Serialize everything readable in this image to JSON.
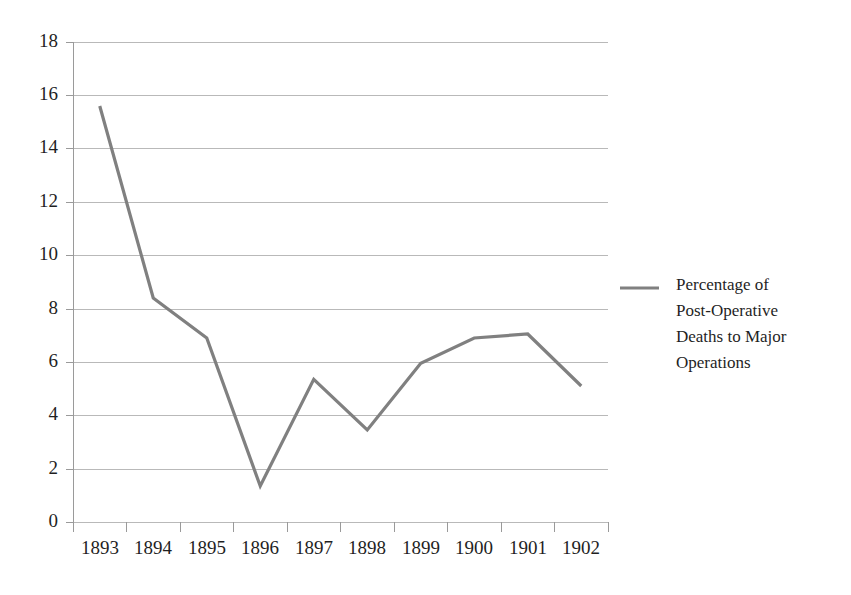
{
  "chart_data": {
    "type": "line",
    "title": "",
    "subtitle": "",
    "xlabel": "",
    "ylabel": "",
    "categories": [
      "1893",
      "1894",
      "1895",
      "1896",
      "1897",
      "1898",
      "1899",
      "1900",
      "1901",
      "1902"
    ],
    "series": [
      {
        "name": "Percentage of Post-Operative Deaths to Major Operations",
        "color": "#808080",
        "values": [
          15.6,
          8.4,
          6.9,
          1.35,
          5.35,
          3.45,
          5.95,
          6.9,
          7.05,
          5.1
        ]
      }
    ],
    "ylim": [
      0,
      18
    ],
    "ytick_step": 2,
    "ytick_labels": [
      "0",
      "2",
      "4",
      "6",
      "8",
      "10",
      "12",
      "14",
      "16",
      "18"
    ],
    "xtick_labels": [
      "1893",
      "1894",
      "1895",
      "1896",
      "1897",
      "1898",
      "1899",
      "1900",
      "1901",
      "1902"
    ],
    "grid": {
      "horizontal": true,
      "vertical": false,
      "color": "#b9b9b9"
    },
    "legend": {
      "position": "right",
      "entries": [
        {
          "label_lines": [
            "Percentage of",
            "Post-Operative",
            "Deaths to Major",
            "Operations"
          ],
          "swatch_type": "line",
          "color": "#808080"
        }
      ]
    },
    "axis": {
      "spine_color": "#9a9a9a",
      "tick_color": "#9a9a9a",
      "background": "#ffffff"
    }
  },
  "legend_lines": {
    "line1": "Percentage of",
    "line2": "Post-Operative",
    "line3": "Deaths to Major",
    "line4": "Operations"
  },
  "y_labels": {
    "v0": "0",
    "v2": "2",
    "v4": "4",
    "v6": "6",
    "v8": "8",
    "v10": "10",
    "v12": "12",
    "v14": "14",
    "v16": "16",
    "v18": "18"
  },
  "x_labels": {
    "y1893": "1893",
    "y1894": "1894",
    "y1895": "1895",
    "y1896": "1896",
    "y1897": "1897",
    "y1898": "1898",
    "y1899": "1899",
    "y1900": "1900",
    "y1901": "1901",
    "y1902": "1902"
  }
}
